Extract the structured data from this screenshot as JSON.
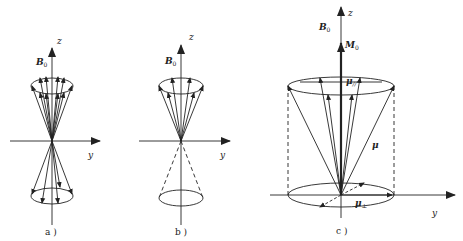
{
  "panels": [
    {
      "id": "a",
      "caption": "a )",
      "field_label": "B",
      "field_sub": "0",
      "z_label": "z",
      "y_label": "y"
    },
    {
      "id": "b",
      "caption": "b )",
      "field_label": "B",
      "field_sub": "0",
      "z_label": "z",
      "y_label": "y"
    },
    {
      "id": "c",
      "caption": "c )",
      "field_label": "B",
      "field_sub": "0",
      "z_label": "z",
      "y_label": "y",
      "magnetization_label": "M",
      "magnetization_sub": "0",
      "mu_label": "μ",
      "mu_parallel_label": "μ",
      "mu_parallel_sub": "//",
      "mu_perp_label": "μ",
      "mu_perp_sub": "⊥"
    }
  ],
  "colors": {
    "ink": "#222222",
    "background": "#ffffff"
  }
}
